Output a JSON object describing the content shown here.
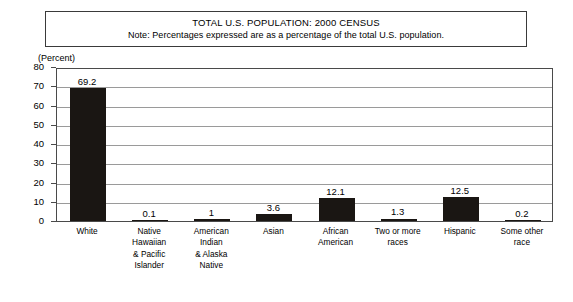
{
  "title": {
    "line1": "TOTAL U.S. POPULATION: 2000 CENSUS",
    "line2": "Note: Percentages expressed are as a percentage of the total U.S. population."
  },
  "axis": {
    "unit_label": "(Percent)",
    "y_ticks": [
      "0",
      "10",
      "20",
      "30",
      "40",
      "50",
      "60",
      "70",
      "80"
    ]
  },
  "chart_data": {
    "type": "bar",
    "title": "TOTAL U.S. POPULATION: 2000 CENSUS",
    "subtitle": "Note: Percentages expressed are as a percentage of the total U.S. population.",
    "xlabel": "",
    "ylabel": "(Percent)",
    "ylim": [
      0,
      80
    ],
    "ytick_step": 10,
    "grid": true,
    "legend": false,
    "bar_color": "#1a1613",
    "categories": [
      "White",
      "Native\nHawaiian\n& Pacific\nIslander",
      "American\nIndian\n& Alaska\nNative",
      "Asian",
      "African\nAmerican",
      "Two or more\nraces",
      "Hispanic",
      "Some other\nrace"
    ],
    "values": [
      69.2,
      0.1,
      1,
      3.6,
      12.1,
      1.3,
      12.5,
      0.2
    ],
    "value_labels": [
      "69.2",
      "0.1",
      "1",
      "3.6",
      "12.1",
      "1.3",
      "12.5",
      "0.2"
    ]
  }
}
